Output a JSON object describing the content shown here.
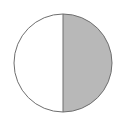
{
  "diagram": {
    "shape": "circle",
    "colors": {
      "background": "#ffffff",
      "outline": "#6e6e6e",
      "shaded_fill": "#b8b8b8",
      "unshaded_fill": "#ffffff"
    },
    "fraction_shaded": "1/2"
  }
}
